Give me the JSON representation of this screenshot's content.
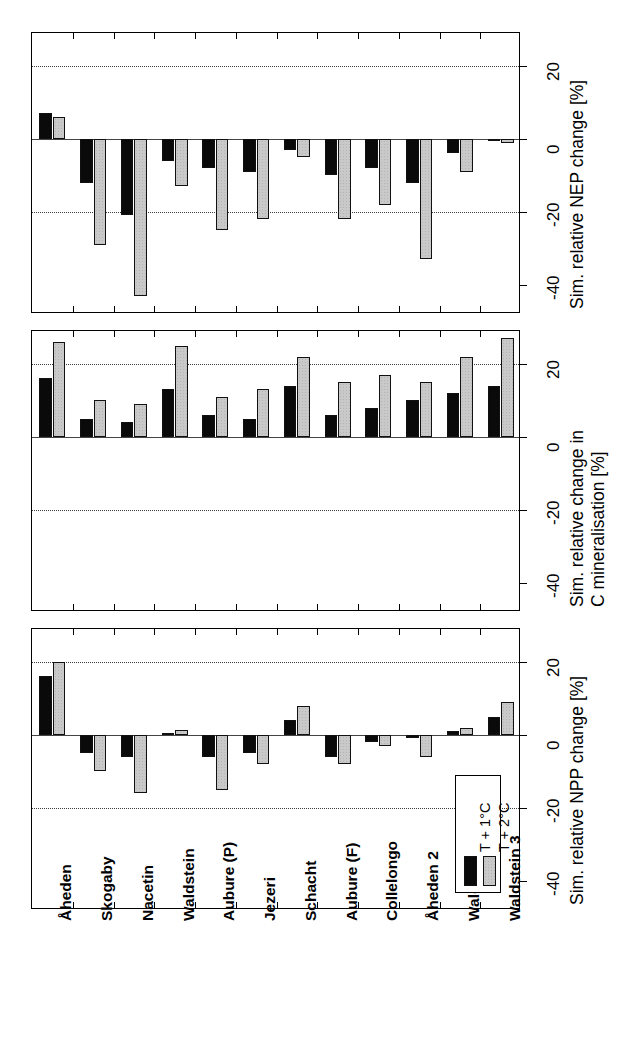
{
  "figure": {
    "orientation": "rotated-90",
    "panel_count": 3,
    "series": [
      {
        "key": "s1",
        "label": "T + 1°C",
        "color": "#0a0a0a"
      },
      {
        "key": "s2",
        "label": "T + 2°C",
        "color": "#c9c9c9"
      }
    ],
    "categories": [
      "Åheden",
      "Skogaby",
      "Nacetin",
      "Waldstein",
      "Aubure (P)",
      "Jezeri",
      "Schacht",
      "Aubure (F)",
      "Collelongo",
      "Åheden 2",
      "Waldstein 2",
      "Waldstein 3"
    ],
    "value_ticks": [
      -40,
      -20,
      0,
      20
    ],
    "value_tick_labels": [
      "-40",
      "-20",
      "0",
      "20"
    ],
    "axis_limits": [
      -48,
      29
    ],
    "grid": "dotted gridlines at -20 and +20; solid line at 0"
  },
  "legend": {
    "position": "bottom-right of NPP panel",
    "entries": [
      {
        "label": "T + 1°C",
        "swatch": "s1"
      },
      {
        "label": "T + 2°C",
        "swatch": "s2"
      }
    ]
  },
  "chart_data": [
    {
      "type": "bar",
      "panel": 1,
      "title": "",
      "xlabel": "",
      "ylabel": "Sim. relative NPP change [%]",
      "ylabel_lines": [
        "Sim. relative NPP change [%]"
      ],
      "ylim": [
        -48,
        29
      ],
      "yticks": [
        -40,
        -20,
        0,
        20
      ],
      "grid": true,
      "legend_position": "inside bottom right",
      "categories": [
        "Åheden",
        "Skogaby",
        "Nacetin",
        "Waldstein",
        "Aubure (P)",
        "Jezeri",
        "Schacht",
        "Aubure (F)",
        "Collelongo",
        "Åheden 2",
        "Waldstein 2",
        "Waldstein 3"
      ],
      "series": [
        {
          "name": "T + 1°C",
          "values": [
            16,
            -5,
            -6,
            0.6,
            -6,
            -5,
            4,
            -6,
            -2,
            -1,
            1,
            5
          ]
        },
        {
          "name": "T + 2°C",
          "values": [
            20,
            -10,
            -16,
            1.2,
            -15,
            -8,
            8,
            -8,
            -3,
            -6,
            2,
            9
          ]
        }
      ]
    },
    {
      "type": "bar",
      "panel": 2,
      "title": "",
      "xlabel": "",
      "ylabel": "Sim. relative change in C mineralisation [%]",
      "ylabel_lines": [
        "Sim. relative change in",
        "C mineralisation [%]"
      ],
      "ylim": [
        -48,
        29
      ],
      "yticks": [
        -40,
        -20,
        0,
        20
      ],
      "grid": true,
      "categories": [
        "Åheden",
        "Skogaby",
        "Nacetin",
        "Waldstein",
        "Aubure (P)",
        "Jezeri",
        "Schacht",
        "Aubure (F)",
        "Collelongo",
        "Åheden 2",
        "Waldstein 2",
        "Waldstein 3"
      ],
      "series": [
        {
          "name": "T + 1°C",
          "values": [
            16,
            5,
            4,
            13,
            6,
            5,
            14,
            6,
            8,
            10,
            12,
            14
          ]
        },
        {
          "name": "T + 2°C",
          "values": [
            26,
            10,
            9,
            25,
            11,
            13,
            22,
            15,
            17,
            15,
            22,
            27
          ]
        }
      ]
    },
    {
      "type": "bar",
      "panel": 3,
      "title": "",
      "xlabel": "",
      "ylabel": "Sim. relative NEP change [%]",
      "ylabel_lines": [
        "Sim. relative NEP change [%]"
      ],
      "ylim": [
        -48,
        29
      ],
      "yticks": [
        -40,
        -20,
        0,
        20
      ],
      "grid": true,
      "categories": [
        "Åheden",
        "Skogaby",
        "Nacetin",
        "Waldstein",
        "Aubure (P)",
        "Jezeri",
        "Schacht",
        "Aubure (F)",
        "Collelongo",
        "Åheden 2",
        "Waldstein 2",
        "Waldstein 3"
      ],
      "series": [
        {
          "name": "T + 1°C",
          "values": [
            7,
            -12,
            -21,
            -6,
            -8,
            -9,
            -3,
            -10,
            -8,
            -12,
            -4,
            -0.6
          ]
        },
        {
          "name": "T + 2°C",
          "values": [
            6,
            -29,
            -43,
            -13,
            -25,
            -22,
            -5,
            -22,
            -18,
            -33,
            -9,
            -1.2
          ]
        }
      ]
    }
  ]
}
